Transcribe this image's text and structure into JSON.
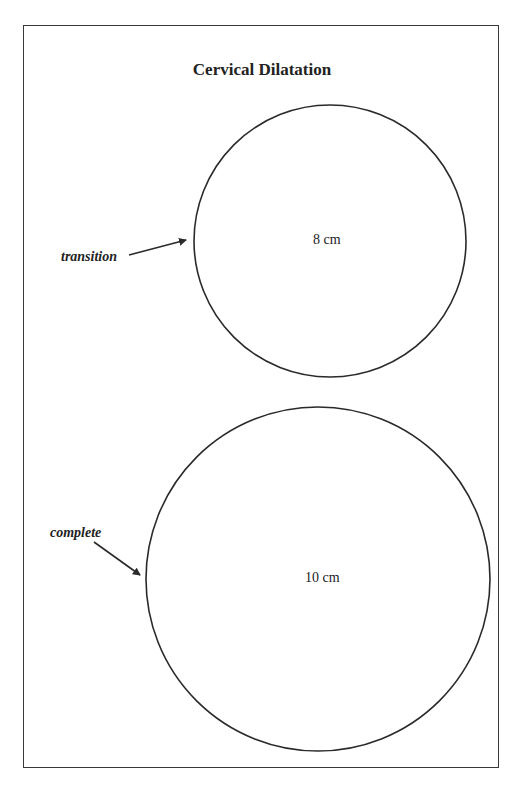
{
  "title": "Cervical Dilatation",
  "circles": [
    {
      "label": "8 cm",
      "annotation": "transition",
      "cx": 330,
      "cy": 241,
      "r": 136
    },
    {
      "label": "10 cm",
      "annotation": "complete",
      "cx": 318,
      "cy": 579,
      "r": 172
    }
  ],
  "colors": {
    "stroke": "#2a2a2a",
    "background": "#ffffff"
  }
}
